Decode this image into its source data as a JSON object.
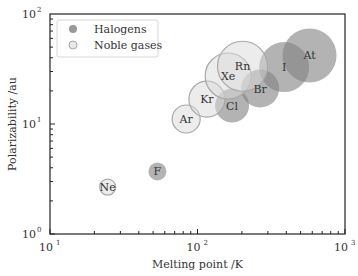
{
  "chart_data": {
    "type": "scatter",
    "title": "",
    "xlabel": "Melting point /K",
    "ylabel": "Polarizability /au",
    "xscale": "log",
    "yscale": "log",
    "xlim": [
      10,
      1000
    ],
    "ylim": [
      1,
      100
    ],
    "x_ticks": [
      {
        "value": 10,
        "label": "10",
        "exp": "1"
      },
      {
        "value": 100,
        "label": "10",
        "exp": "2"
      },
      {
        "value": 1000,
        "label": "10",
        "exp": "3"
      }
    ],
    "y_ticks": [
      {
        "value": 1,
        "label": "10",
        "exp": "0"
      },
      {
        "value": 10,
        "label": "10",
        "exp": "1"
      },
      {
        "value": 100,
        "label": "10",
        "exp": "2"
      }
    ],
    "grid": false,
    "legend_position": "upper left",
    "series": [
      {
        "name": "Halogens",
        "color": "#808080",
        "fill_opacity": 0.6,
        "points": [
          {
            "label": "F",
            "x": 53.5,
            "y": 3.7,
            "r": 9
          },
          {
            "label": "Cl",
            "x": 171.6,
            "y": 14.7,
            "r": 17
          },
          {
            "label": "Br",
            "x": 265.8,
            "y": 21.0,
            "r": 19
          },
          {
            "label": "I",
            "x": 386.9,
            "y": 32.9,
            "r": 25
          },
          {
            "label": "At",
            "x": 575,
            "y": 42.0,
            "r": 27
          }
        ]
      },
      {
        "name": "Noble gases",
        "color": "#d9d9d9",
        "fill_opacity": 0.5,
        "points": [
          {
            "label": "Ne",
            "x": 24.6,
            "y": 2.67,
            "r": 8
          },
          {
            "label": "Ar",
            "x": 83.8,
            "y": 11.1,
            "r": 14
          },
          {
            "label": "Kr",
            "x": 115.8,
            "y": 16.8,
            "r": 18
          },
          {
            "label": "Xe",
            "x": 161.4,
            "y": 27.3,
            "r": 23
          },
          {
            "label": "Rn",
            "x": 202,
            "y": 33.5,
            "r": 25
          }
        ]
      }
    ]
  }
}
